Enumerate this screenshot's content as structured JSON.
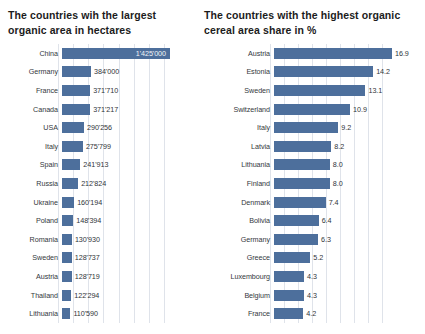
{
  "chart_data": [
    {
      "type": "bar",
      "orientation": "horizontal",
      "title": "The countries wih the largest organic area in hectares",
      "title_lines": [
        "The countries wih the largest",
        "organic area in hectares"
      ],
      "xlabel": "",
      "ylabel": "",
      "xlim": [
        0,
        1425000
      ],
      "grid": true,
      "gridlines": [
        0,
        200000,
        400000,
        600000,
        800000,
        1000000,
        1200000,
        1400000
      ],
      "legend": "none",
      "bar_color": "#4d6f9c",
      "categories": [
        "China",
        "Germany",
        "France",
        "Canada",
        "USA",
        "Italy",
        "Spain",
        "Russia",
        "Ukraine",
        "Poland",
        "Romania",
        "Sweden",
        "Austria",
        "Thailand",
        "Lithuania"
      ],
      "values": [
        1425000,
        384000,
        371710,
        371217,
        290256,
        275799,
        241913,
        212824,
        160194,
        148394,
        130930,
        128737,
        128719,
        122294,
        110590
      ],
      "value_labels": [
        "1'425'000",
        "384'000",
        "371'710",
        "371'217",
        "290'256",
        "275'799",
        "241'913",
        "212'824",
        "160'194",
        "148'394",
        "130'930",
        "128'737",
        "128'719",
        "122'294",
        "110'590"
      ],
      "label_inside": [
        true,
        false,
        false,
        false,
        false,
        false,
        false,
        false,
        false,
        false,
        false,
        false,
        false,
        false,
        false
      ]
    },
    {
      "type": "bar",
      "orientation": "horizontal",
      "title": "The countries with the highest organic cereal area share in %",
      "title_lines": [
        "The countries with the highest organic",
        "cereal area share in %"
      ],
      "xlabel": "",
      "ylabel": "",
      "xlim": [
        0,
        16.9
      ],
      "grid": true,
      "gridlines": [
        0,
        2,
        4,
        6,
        8,
        10,
        12,
        14,
        16
      ],
      "legend": "none",
      "bar_color": "#4d6f9c",
      "categories": [
        "Austria",
        "Estonia",
        "Sweden",
        "Switzerland",
        "Italy",
        "Latvia",
        "Lithuania",
        "Finland",
        "Denmark",
        "Bolivia",
        "Germany",
        "Greece",
        "Luxembourg",
        "Belgium",
        "France"
      ],
      "values": [
        16.9,
        14.2,
        13.1,
        10.9,
        9.2,
        8.2,
        8.0,
        8.0,
        7.4,
        6.4,
        6.3,
        5.2,
        4.3,
        4.3,
        4.2
      ],
      "value_labels": [
        "16.9",
        "14.2",
        "13.1",
        "10.9",
        "9.2",
        "8.2",
        "8.0",
        "8.0",
        "7.4",
        "6.4",
        "6.3",
        "5.2",
        "4.3",
        "4.3",
        "4.2"
      ],
      "label_inside": [
        false,
        false,
        false,
        false,
        false,
        false,
        false,
        false,
        false,
        false,
        false,
        false,
        false,
        false,
        false
      ]
    }
  ],
  "layout": {
    "left_panel": {
      "label_width_px": 52,
      "plot_width_px": 138,
      "row_height_px": 18.6,
      "bar_max_px": 108
    },
    "right_panel": {
      "label_width_px": 68,
      "plot_width_px": 155,
      "row_height_px": 18.6,
      "bar_max_px": 118
    }
  }
}
